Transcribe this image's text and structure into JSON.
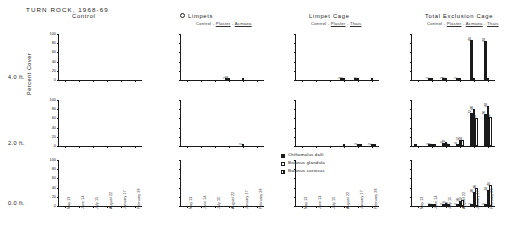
{
  "figure": {
    "title": "TURN ROCK, 1968-69",
    "ylabel": "Percent Cover",
    "rows": [
      {
        "label": "4.0 ft."
      },
      {
        "label": "2.0 ft."
      },
      {
        "label": "0.0 ft."
      }
    ],
    "panels": [
      {
        "title": "Control",
        "subtitle": "",
        "marker": ""
      },
      {
        "title": "Limpets",
        "subtitle": "Control - Plaster - Acmaea",
        "marker": "open-circle"
      },
      {
        "title": "Limpet  Cage",
        "subtitle": "Control - Plaster - Thais",
        "marker": ""
      },
      {
        "title": "Total  Exclusion  Cage",
        "subtitle": "Control - Plaster - Acmaea - Thais",
        "marker": ""
      }
    ],
    "legend": [
      {
        "label": "Chthamalus  dalli",
        "swatch": "filled-black"
      },
      {
        "label": "Balanus  glandula",
        "swatch": "open-white"
      },
      {
        "label": "Balanus  cariosus",
        "swatch": "hatched"
      }
    ]
  },
  "chart_data": {
    "type": "bar",
    "title": "TURN ROCK, 1968-69",
    "xlabel": "",
    "ylabel": "Percent Cover",
    "ylim": [
      0,
      100
    ],
    "yticks": [
      0,
      20,
      40,
      60,
      80,
      100
    ],
    "grid": false,
    "legend_position": "center-bottom",
    "categories": [
      "May 13",
      "June 14",
      "July 15",
      "August 22",
      "January 17",
      "February 26"
    ],
    "series_names": [
      "Chthamalus dalli",
      "Balanus glandula",
      "Balanus cariosus"
    ],
    "panels": [
      {
        "row": "4.0 ft.",
        "column": "Control",
        "series": [
          {
            "name": "Chthamalus dalli",
            "values": [
              0,
              0,
              0,
              0,
              0,
              0
            ]
          },
          {
            "name": "Balanus glandula",
            "values": [
              0,
              0,
              0,
              0,
              0,
              0
            ]
          },
          {
            "name": "Balanus cariosus",
            "values": [
              0,
              0,
              0,
              0,
              0,
              0
            ]
          }
        ]
      },
      {
        "row": "4.0 ft.",
        "column": "Limpets",
        "series": [
          {
            "name": "Chthamalus dalli",
            "values": [
              0,
              0,
              0,
              3,
              0,
              0
            ]
          },
          {
            "name": "Balanus glandula",
            "values": [
              0,
              0,
              0,
              4,
              1,
              0
            ]
          },
          {
            "name": "Balanus cariosus",
            "values": [
              0,
              0,
              0,
              0,
              0,
              0
            ]
          }
        ]
      },
      {
        "row": "4.0 ft.",
        "column": "Limpet Cage",
        "series": [
          {
            "name": "Chthamalus dalli",
            "values": [
              0,
              0,
              0,
              2,
              1,
              0
            ]
          },
          {
            "name": "Balanus glandula",
            "values": [
              0,
              0,
              0,
              3,
              2,
              1
            ]
          },
          {
            "name": "Balanus cariosus",
            "values": [
              0,
              0,
              0,
              0,
              0,
              0
            ]
          }
        ]
      },
      {
        "row": "4.0 ft.",
        "column": "Total Exclusion Cage",
        "series": [
          {
            "name": "Chthamalus dalli",
            "values": [
              0,
              2,
              3,
              2,
              86,
              84
            ]
          },
          {
            "name": "Balanus glandula",
            "values": [
              0,
              1,
              2,
              1,
              4,
              3
            ]
          },
          {
            "name": "Balanus cariosus",
            "values": [
              0,
              0,
              0,
              0,
              0,
              0
            ]
          }
        ]
      },
      {
        "row": "2.0 ft.",
        "column": "Control",
        "series": [
          {
            "name": "Chthamalus dalli",
            "values": [
              0,
              0,
              0,
              0,
              0,
              0
            ]
          },
          {
            "name": "Balanus glandula",
            "values": [
              0,
              0,
              0,
              0,
              0,
              0
            ]
          },
          {
            "name": "Balanus cariosus",
            "values": [
              0,
              0,
              0,
              0,
              0,
              0
            ]
          }
        ]
      },
      {
        "row": "2.0 ft.",
        "column": "Limpets",
        "series": [
          {
            "name": "Chthamalus dalli",
            "values": [
              0,
              0,
              0,
              0,
              0,
              0
            ]
          },
          {
            "name": "Balanus glandula",
            "values": [
              0,
              0,
              0,
              0,
              2,
              0
            ]
          },
          {
            "name": "Balanus cariosus",
            "values": [
              0,
              0,
              0,
              0,
              0,
              0
            ]
          }
        ]
      },
      {
        "row": "2.0 ft.",
        "column": "Limpet Cage",
        "series": [
          {
            "name": "Chthamalus dalli",
            "values": [
              0,
              0,
              0,
              0,
              0,
              0
            ]
          },
          {
            "name": "Balanus glandula",
            "values": [
              0,
              0,
              0,
              1,
              3,
              2
            ]
          },
          {
            "name": "Balanus cariosus",
            "values": [
              0,
              0,
              0,
              0,
              1,
              1
            ]
          }
        ]
      },
      {
        "row": "2.0 ft.",
        "column": "Total Exclusion Cage",
        "series": [
          {
            "name": "Chthamalus dalli",
            "values": [
              1,
              3,
              6,
              4,
              72,
              70
            ]
          },
          {
            "name": "Balanus glandula",
            "values": [
              0,
              2,
              8,
              12,
              80,
              88
            ]
          },
          {
            "name": "Balanus cariosus",
            "values": [
              0,
              1,
              3,
              14,
              60,
              62
            ]
          }
        ]
      },
      {
        "row": "0.0 ft.",
        "column": "Control",
        "series": [
          {
            "name": "Chthamalus dalli",
            "values": [
              0,
              0,
              0,
              0,
              0,
              0
            ]
          },
          {
            "name": "Balanus glandula",
            "values": [
              0,
              0,
              0,
              0,
              0,
              0
            ]
          },
          {
            "name": "Balanus cariosus",
            "values": [
              0,
              0,
              0,
              0,
              0,
              0
            ]
          }
        ]
      },
      {
        "row": "0.0 ft.",
        "column": "Limpets",
        "series": [
          {
            "name": "Chthamalus dalli",
            "values": [
              0,
              0,
              0,
              0,
              0,
              0
            ]
          },
          {
            "name": "Balanus glandula",
            "values": [
              0,
              0,
              0,
              0,
              0,
              0
            ]
          },
          {
            "name": "Balanus cariosus",
            "values": [
              0,
              0,
              0,
              0,
              0,
              0
            ]
          }
        ]
      },
      {
        "row": "0.0 ft.",
        "column": "Limpet Cage",
        "series": [
          {
            "name": "Chthamalus dalli",
            "values": [
              0,
              0,
              0,
              0,
              0,
              0
            ]
          },
          {
            "name": "Balanus glandula",
            "values": [
              0,
              0,
              0,
              0,
              0,
              0
            ]
          },
          {
            "name": "Balanus cariosus",
            "values": [
              0,
              0,
              0,
              0,
              0,
              0
            ]
          }
        ]
      },
      {
        "row": "0.0 ft.",
        "column": "Total Exclusion Cage",
        "series": [
          {
            "name": "Chthamalus dalli",
            "values": [
              0,
              1,
              2,
              2,
              3,
              2
            ]
          },
          {
            "name": "Balanus glandula",
            "values": [
              0,
              2,
              6,
              10,
              30,
              34
            ]
          },
          {
            "name": "Balanus cariosus",
            "values": [
              0,
              1,
              4,
              12,
              40,
              46
            ]
          }
        ]
      }
    ]
  }
}
